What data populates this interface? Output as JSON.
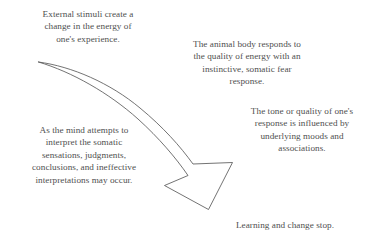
{
  "diagram": {
    "background_color": "#ffffff",
    "text_color": "#4f4f4f",
    "arrow_color": "#5a5a5a",
    "blocks": [
      {
        "name": "external-stimuli",
        "text": "External stimuli create a\nchange in the energy of\none's experience."
      },
      {
        "name": "animal-body",
        "text": "The animal body responds to\nthe quality of energy with an\ninstinctive, somatic fear\nresponse."
      },
      {
        "name": "tone-quality",
        "text": "The tone or quality of one's\nresponse is influenced by\nunderlying moods and\nassociations."
      },
      {
        "name": "mind-attempts",
        "text": "As the mind attempts to\ninterpret the somatic\nsensations, judgments,\nconclusions, and ineffective\ninterpretations may occur."
      },
      {
        "name": "learning-stops",
        "text": "Learning and change stop."
      }
    ],
    "arrow": {
      "name": "curved-descending-arrow",
      "direction": "upper-left to lower-right",
      "style": "tapered outlined curve with open arrowhead"
    }
  }
}
